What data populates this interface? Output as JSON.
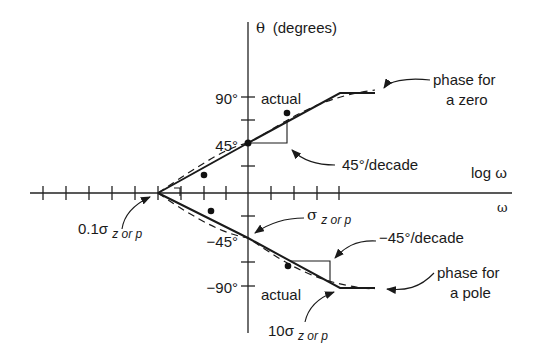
{
  "diagram": {
    "y_axis_label_symbol": "θ",
    "y_axis_label_unit": "(degrees)",
    "x_axis_label_log": "log ω",
    "x_axis_label_lin": "ω",
    "y_ticks": [
      {
        "label": "90°",
        "value": 90
      },
      {
        "label": "45°",
        "value": 45
      },
      {
        "label": "−45°",
        "value": -45
      },
      {
        "label": "−90°",
        "value": -90
      }
    ],
    "labels": {
      "actual_zero": "actual",
      "actual_pole": "actual",
      "phase_zero_line1": "phase for",
      "phase_zero_line2": "a zero",
      "phase_pole_line1": "phase for",
      "phase_pole_line2": "a pole",
      "slope_zero": "45°/decade",
      "slope_pole": "−45°/decade",
      "break_low_prefix": "0.1σ",
      "break_low_sub": "z or p",
      "break_mid_prefix": "σ",
      "break_mid_sub": "z or p",
      "break_high_prefix": "10σ",
      "break_high_sub": "z or p"
    },
    "zero_asymptote": [
      {
        "omega": "0.1σ",
        "theta": 0
      },
      {
        "omega": "σ",
        "theta": 45
      },
      {
        "omega": "10σ",
        "theta": 90
      }
    ],
    "pole_asymptote": [
      {
        "omega": "0.1σ",
        "theta": 0
      },
      {
        "omega": "σ",
        "theta": -45
      },
      {
        "omega": "10σ",
        "theta": -90
      }
    ]
  }
}
